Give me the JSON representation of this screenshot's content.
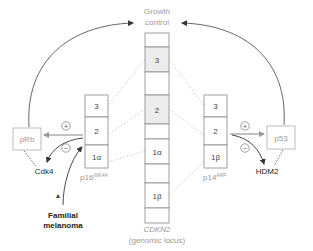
{
  "title": {
    "line1": "Growth",
    "line2": "control"
  },
  "locus": {
    "name": "CDKN2",
    "subtitle": "(genomic locus)",
    "segments": [
      {
        "label": "",
        "shaded": false
      },
      {
        "label": "3",
        "shaded": true
      },
      {
        "label": "",
        "shaded": false
      },
      {
        "label": "2",
        "shaded": true
      },
      {
        "label": "",
        "shaded": false
      },
      {
        "label": "1α",
        "shaded": false
      },
      {
        "label": "",
        "shaded": false
      },
      {
        "label": "1β",
        "shaded": false
      },
      {
        "label": "",
        "shaded": false
      }
    ]
  },
  "left_gene": {
    "name": "p16",
    "superscript": "INK4A",
    "exons": [
      "3",
      "2",
      "1α"
    ]
  },
  "right_gene": {
    "name": "p14",
    "superscript": "ARF",
    "exons": [
      "3",
      "2",
      "1β"
    ]
  },
  "left_target": {
    "name": "pRb",
    "inhibitor": "Cdk4",
    "plus": "+",
    "minus": "−"
  },
  "right_target": {
    "name": "p53",
    "inhibitor": "HDM2",
    "plus": "+",
    "minus": "−"
  },
  "disease": {
    "line1": "Familial",
    "line2": "melanoma",
    "marker": "▲"
  },
  "colors": {
    "line": "#555555",
    "box_border": "#aaaaaa",
    "shaded": "#ececec",
    "light_text": "#999999",
    "dark_text": "#222222"
  }
}
